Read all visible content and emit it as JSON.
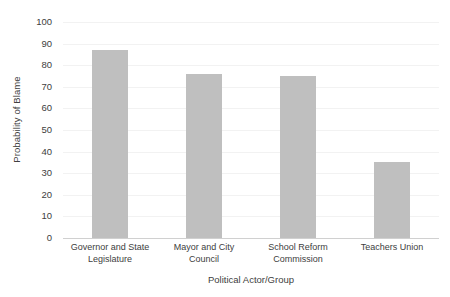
{
  "chart_data": {
    "type": "bar",
    "title": "",
    "subtitle": "",
    "xlabel": "Political Actor/Group",
    "ylabel": "Probability of Blame",
    "categories": [
      "Governor and State Legislature",
      "Mayor and City Council",
      "School Reform Commission",
      "Teachers Union"
    ],
    "values": [
      87,
      76,
      75,
      35
    ],
    "ylim": [
      0,
      100
    ],
    "ytick_step": 10,
    "yticks": [
      0,
      10,
      20,
      30,
      40,
      50,
      60,
      70,
      80,
      90,
      100
    ],
    "ytick_labels": [
      "0",
      "10",
      "20",
      "30",
      "40",
      "50",
      "60",
      "70",
      "80",
      "90",
      "100"
    ],
    "grid": true,
    "grid_axis": "y",
    "legend": false,
    "legend_position": "none",
    "bar_color": "#bfbfbf",
    "gridline_color": "#f2f2f2",
    "axis_color": "#d0d0d0",
    "text_color": "#404040",
    "background_color": "#ffffff"
  },
  "axes": {
    "x_title": "Political Actor/Group",
    "y_title": "Probability of Blame",
    "x_tick_labels": [
      "Governor and State Legislature",
      "Mayor and City Council",
      "School Reform Commission",
      "Teachers Union"
    ]
  }
}
